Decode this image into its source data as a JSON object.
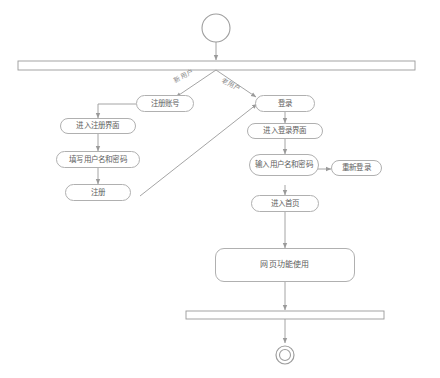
{
  "diagram": {
    "type": "uml-activity-diagram",
    "start_node": "start-node",
    "fork_bar": "fork-bar",
    "join_bar": "join-bar",
    "final_node": "final-node",
    "edge_labels": [
      {
        "id": "new-user",
        "text": "新用户"
      },
      {
        "id": "old-user",
        "text": "老用户"
      }
    ],
    "nodes": [
      {
        "id": "register-account",
        "text": "注册账号"
      },
      {
        "id": "login",
        "text": "登录"
      },
      {
        "id": "enter-register-page",
        "text": "进入注册界面"
      },
      {
        "id": "enter-login-page",
        "text": "进入登录界面"
      },
      {
        "id": "fill-credentials",
        "text": "填写用户名和密码"
      },
      {
        "id": "input-credentials",
        "text": "输入用户名和密码"
      },
      {
        "id": "relogin",
        "text": "重新登录"
      },
      {
        "id": "register",
        "text": "注册"
      },
      {
        "id": "enter-homepage",
        "text": "进入首页"
      },
      {
        "id": "web-function-use",
        "text": "网页功能使用"
      }
    ]
  }
}
